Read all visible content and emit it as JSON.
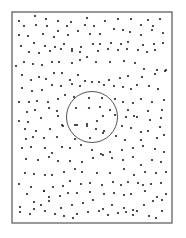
{
  "diagram": {
    "canvas": {
      "width": 186,
      "height": 238,
      "background": "#ffffff"
    },
    "frame": {
      "x": 12,
      "y": 12,
      "width": 160,
      "height": 211,
      "stroke": "#555555",
      "stroke_width": 1.2
    },
    "circle": {
      "cx": 92,
      "cy": 117,
      "r": 25.5,
      "stroke": "#555555",
      "stroke_width": 1
    },
    "dot": {
      "r": 1.1,
      "fill": "#222222"
    },
    "dots": [
      [
        19,
        21
      ],
      [
        35,
        16
      ],
      [
        46,
        19
      ],
      [
        58,
        21
      ],
      [
        71,
        22
      ],
      [
        87,
        18
      ],
      [
        105,
        21
      ],
      [
        118,
        19
      ],
      [
        131,
        19
      ],
      [
        148,
        20
      ],
      [
        160,
        19
      ],
      [
        24,
        26
      ],
      [
        36,
        25
      ],
      [
        47,
        26
      ],
      [
        67,
        26
      ],
      [
        85,
        25
      ],
      [
        94,
        26
      ],
      [
        141,
        25
      ],
      [
        153,
        26
      ],
      [
        19,
        35
      ],
      [
        28,
        36
      ],
      [
        43,
        34
      ],
      [
        54,
        37
      ],
      [
        58,
        31
      ],
      [
        68,
        35
      ],
      [
        78,
        31
      ],
      [
        90,
        34
      ],
      [
        100,
        34
      ],
      [
        114,
        29
      ],
      [
        123,
        30
      ],
      [
        130,
        32
      ],
      [
        141,
        35
      ],
      [
        152,
        30
      ],
      [
        163,
        33
      ],
      [
        21,
        46
      ],
      [
        34,
        43
      ],
      [
        45,
        46
      ],
      [
        55,
        47
      ],
      [
        64,
        44
      ],
      [
        72,
        49
      ],
      [
        81,
        47
      ],
      [
        93,
        44
      ],
      [
        100,
        44
      ],
      [
        111,
        43
      ],
      [
        121,
        44
      ],
      [
        128,
        42
      ],
      [
        143,
        45
      ],
      [
        154,
        44
      ],
      [
        163,
        43
      ],
      [
        29,
        52
      ],
      [
        39,
        53
      ],
      [
        50,
        51
      ],
      [
        61,
        49
      ],
      [
        72,
        51
      ],
      [
        80,
        52
      ],
      [
        87,
        57
      ],
      [
        98,
        51
      ],
      [
        108,
        49
      ],
      [
        118,
        50
      ],
      [
        127,
        49
      ],
      [
        138,
        50
      ],
      [
        147,
        52
      ],
      [
        155,
        50
      ],
      [
        16,
        66
      ],
      [
        24,
        62
      ],
      [
        33,
        64
      ],
      [
        42,
        65
      ],
      [
        52,
        62
      ],
      [
        59,
        62
      ],
      [
        72,
        63
      ],
      [
        80,
        60
      ],
      [
        96,
        62
      ],
      [
        110,
        62
      ],
      [
        124,
        61
      ],
      [
        135,
        63
      ],
      [
        144,
        69
      ],
      [
        157,
        70
      ],
      [
        165,
        71
      ],
      [
        22,
        75
      ],
      [
        31,
        80
      ],
      [
        39,
        77
      ],
      [
        46,
        79
      ],
      [
        54,
        73
      ],
      [
        62,
        73
      ],
      [
        70,
        80
      ],
      [
        78,
        75
      ],
      [
        85,
        81
      ],
      [
        99,
        82
      ],
      [
        109,
        80
      ],
      [
        120,
        78
      ],
      [
        128,
        76
      ],
      [
        142,
        77
      ],
      [
        155,
        74
      ],
      [
        166,
        70
      ],
      [
        22,
        88
      ],
      [
        32,
        91
      ],
      [
        42,
        90
      ],
      [
        52,
        85
      ],
      [
        61,
        86
      ],
      [
        72,
        84
      ],
      [
        80,
        86
      ],
      [
        92,
        82
      ],
      [
        104,
        85
      ],
      [
        114,
        86
      ],
      [
        123,
        87
      ],
      [
        131,
        89
      ],
      [
        137,
        85
      ],
      [
        149,
        86
      ],
      [
        158,
        89
      ],
      [
        19,
        102
      ],
      [
        29,
        102
      ],
      [
        37,
        101
      ],
      [
        48,
        102
      ],
      [
        58,
        99
      ],
      [
        65,
        95
      ],
      [
        74,
        97
      ],
      [
        89,
        98
      ],
      [
        102,
        98
      ],
      [
        115,
        99
      ],
      [
        123,
        102
      ],
      [
        133,
        103
      ],
      [
        141,
        99
      ],
      [
        152,
        102
      ],
      [
        164,
        100
      ],
      [
        27,
        112
      ],
      [
        35,
        110
      ],
      [
        49,
        108
      ],
      [
        57,
        111
      ],
      [
        76,
        108
      ],
      [
        89,
        108
      ],
      [
        100,
        107
      ],
      [
        110,
        110
      ],
      [
        128,
        110
      ],
      [
        137,
        117
      ],
      [
        148,
        111
      ],
      [
        162,
        110
      ],
      [
        19,
        121
      ],
      [
        28,
        122
      ],
      [
        41,
        118
      ],
      [
        58,
        116
      ],
      [
        63,
        126
      ],
      [
        77,
        125
      ],
      [
        87,
        124
      ],
      [
        97,
        121
      ],
      [
        103,
        116
      ],
      [
        115,
        115
      ],
      [
        126,
        117
      ],
      [
        134,
        116
      ],
      [
        150,
        120
      ],
      [
        161,
        118
      ],
      [
        25,
        129
      ],
      [
        36,
        131
      ],
      [
        50,
        129
      ],
      [
        62,
        125
      ],
      [
        75,
        125
      ],
      [
        87,
        126
      ],
      [
        96,
        129
      ],
      [
        104,
        131
      ],
      [
        122,
        126
      ],
      [
        131,
        128
      ],
      [
        141,
        132
      ],
      [
        148,
        131
      ],
      [
        160,
        127
      ],
      [
        26,
        139
      ],
      [
        33,
        137
      ],
      [
        44,
        138
      ],
      [
        57,
        137
      ],
      [
        75,
        139
      ],
      [
        90,
        138
      ],
      [
        103,
        133
      ],
      [
        116,
        136
      ],
      [
        125,
        140
      ],
      [
        141,
        140
      ],
      [
        157,
        138
      ],
      [
        164,
        135
      ],
      [
        22,
        148
      ],
      [
        31,
        147
      ],
      [
        45,
        148
      ],
      [
        52,
        153
      ],
      [
        62,
        147
      ],
      [
        70,
        148
      ],
      [
        81,
        145
      ],
      [
        92,
        150
      ],
      [
        101,
        154
      ],
      [
        110,
        152
      ],
      [
        122,
        150
      ],
      [
        133,
        148
      ],
      [
        143,
        146
      ],
      [
        155,
        149
      ],
      [
        164,
        152
      ],
      [
        26,
        159
      ],
      [
        38,
        160
      ],
      [
        49,
        157
      ],
      [
        58,
        161
      ],
      [
        70,
        161
      ],
      [
        82,
        162
      ],
      [
        93,
        158
      ],
      [
        103,
        155
      ],
      [
        112,
        158
      ],
      [
        123,
        160
      ],
      [
        133,
        157
      ],
      [
        141,
        165
      ],
      [
        152,
        160
      ],
      [
        161,
        162
      ],
      [
        25,
        173
      ],
      [
        34,
        174
      ],
      [
        45,
        175
      ],
      [
        52,
        175
      ],
      [
        64,
        172
      ],
      [
        75,
        169
      ],
      [
        82,
        172
      ],
      [
        97,
        173
      ],
      [
        110,
        173
      ],
      [
        124,
        169
      ],
      [
        134,
        175
      ],
      [
        145,
        172
      ],
      [
        156,
        173
      ],
      [
        166,
        172
      ],
      [
        19,
        184
      ],
      [
        31,
        187
      ],
      [
        44,
        191
      ],
      [
        53,
        187
      ],
      [
        63,
        186
      ],
      [
        70,
        181
      ],
      [
        81,
        184
      ],
      [
        90,
        183
      ],
      [
        102,
        185
      ],
      [
        113,
        182
      ],
      [
        121,
        185
      ],
      [
        128,
        182
      ],
      [
        138,
        183
      ],
      [
        143,
        185
      ],
      [
        151,
        184
      ],
      [
        161,
        183
      ],
      [
        27,
        194
      ],
      [
        34,
        202
      ],
      [
        44,
        191
      ],
      [
        49,
        197
      ],
      [
        60,
        196
      ],
      [
        68,
        193
      ],
      [
        77,
        193
      ],
      [
        90,
        192
      ],
      [
        104,
        194
      ],
      [
        114,
        193
      ],
      [
        124,
        195
      ],
      [
        131,
        194
      ],
      [
        145,
        191
      ],
      [
        157,
        197
      ],
      [
        166,
        194
      ],
      [
        20,
        207
      ],
      [
        34,
        209
      ],
      [
        41,
        205
      ],
      [
        49,
        201
      ],
      [
        61,
        208
      ],
      [
        72,
        205
      ],
      [
        83,
        203
      ],
      [
        93,
        200
      ],
      [
        103,
        209
      ],
      [
        112,
        205
      ],
      [
        124,
        208
      ],
      [
        133,
        210
      ],
      [
        144,
        205
      ],
      [
        153,
        201
      ],
      [
        162,
        200
      ],
      [
        20,
        212
      ],
      [
        30,
        214
      ],
      [
        45,
        211
      ],
      [
        55,
        214
      ],
      [
        64,
        216
      ],
      [
        77,
        214
      ],
      [
        88,
        212
      ],
      [
        99,
        211
      ],
      [
        108,
        215
      ],
      [
        118,
        213
      ],
      [
        126,
        212
      ],
      [
        137,
        211
      ],
      [
        149,
        216
      ],
      [
        162,
        211
      ],
      [
        73,
        218
      ],
      [
        133,
        215
      ],
      [
        156,
        218
      ]
    ]
  }
}
